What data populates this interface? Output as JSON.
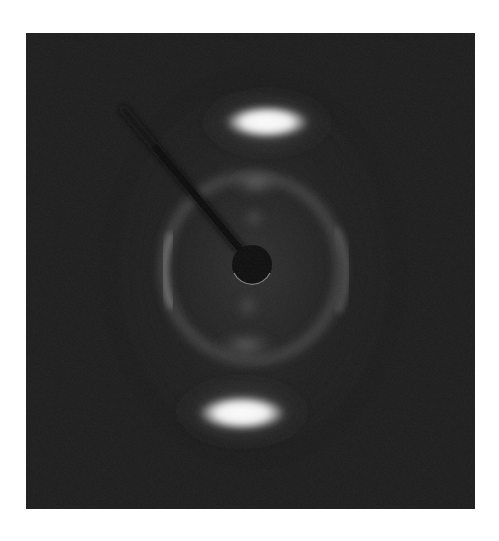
{
  "image": {
    "subject": "X-ray diffraction pattern",
    "description": "Fiber diffraction pattern with two strong meridional reflections, a diffuse ring, and a beamstop with its support arm",
    "colors": {
      "page_background": "#ffffff",
      "detector_background": "#1b1b1b",
      "reflection_core": "#ffffff",
      "ring": "#6a6a6a",
      "beamstop": "#0c0c0c"
    },
    "features": [
      {
        "name": "top-meridional-reflection",
        "intensity": "very strong"
      },
      {
        "name": "bottom-meridional-reflection",
        "intensity": "very strong"
      },
      {
        "name": "diffuse-ring",
        "intensity": "weak"
      },
      {
        "name": "inner-upper-reflection",
        "intensity": "weak"
      },
      {
        "name": "inner-lower-reflection",
        "intensity": "weak"
      },
      {
        "name": "beamstop",
        "intensity": "none"
      },
      {
        "name": "beamstop-arm",
        "intensity": "none"
      }
    ]
  }
}
